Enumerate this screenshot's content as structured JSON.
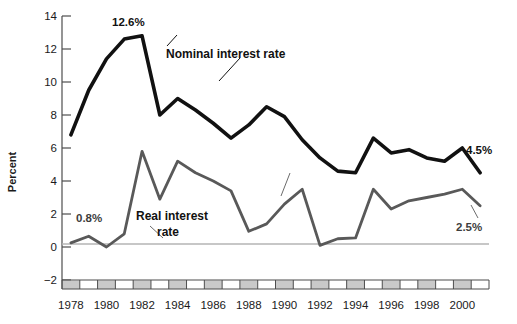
{
  "chart_data": {
    "type": "line",
    "title": "",
    "xlabel": "",
    "ylabel": "Percent",
    "ylim": [
      -2,
      14
    ],
    "xlim": [
      1977.5,
      2001.5
    ],
    "yticks": [
      -2,
      0,
      2,
      4,
      6,
      8,
      10,
      12,
      14
    ],
    "ytick_labels": [
      "−2",
      "0",
      "2",
      "4",
      "6",
      "8",
      "10",
      "12",
      "14"
    ],
    "xticks": [
      1978,
      1980,
      1982,
      1984,
      1986,
      1988,
      1990,
      1992,
      1994,
      1996,
      1998,
      2000
    ],
    "xtick_labels": [
      "1978",
      "1980",
      "1982",
      "1984",
      "1986",
      "1988",
      "1990",
      "1992",
      "1994",
      "1996",
      "1998",
      "2000"
    ],
    "grid": false,
    "legend_position": "inline-annotation",
    "zero_line": true,
    "x": [
      1978,
      1979,
      1980,
      1981,
      1982,
      1983,
      1984,
      1985,
      1986,
      1987,
      1988,
      1989,
      1990,
      1991,
      1992,
      1993,
      1994,
      1995,
      1996,
      1997,
      1998,
      1999,
      2000,
      2001
    ],
    "series": [
      {
        "name": "Nominal interest rate",
        "color": "#111111",
        "width": 3.6,
        "values": [
          6.8,
          9.5,
          11.4,
          12.6,
          12.8,
          8.0,
          9.0,
          8.3,
          7.5,
          6.6,
          7.4,
          8.5,
          7.9,
          6.5,
          5.4,
          4.6,
          4.5,
          6.6,
          5.7,
          5.9,
          5.4,
          5.2,
          6.0,
          4.5
        ]
      },
      {
        "name": "Real interest rate",
        "color": "#595959",
        "width": 2.8,
        "values": [
          0.25,
          0.65,
          0.0,
          0.8,
          5.8,
          2.9,
          5.2,
          4.5,
          4.0,
          3.4,
          0.95,
          1.4,
          2.6,
          3.5,
          0.1,
          0.5,
          0.55,
          3.5,
          2.3,
          2.8,
          3.0,
          3.2,
          3.5,
          2.5
        ]
      }
    ],
    "annotations": [
      {
        "label": "12.6%",
        "style": "bold-dark",
        "x": 1981,
        "y": 12.6
      },
      {
        "label": "4.5%",
        "style": "bold-dark",
        "x": 2001,
        "y": 4.5
      },
      {
        "label": "0.8%",
        "style": "bold-gray",
        "x": 1981,
        "y": 0.8
      },
      {
        "label": "2.5%",
        "style": "bold-gray",
        "x": 2001,
        "y": 2.5
      }
    ],
    "series_labels": [
      {
        "label": "Nominal interest rate",
        "points_to": "nominal-series"
      },
      {
        "label": "Real interest",
        "label2": "rate",
        "points_to": "real-series"
      }
    ]
  },
  "axis": {
    "y_title": "Percent",
    "x_band_style": "alternating-gray-year-blocks"
  },
  "colors": {
    "nominal": "#111111",
    "real": "#595959",
    "zero_line": "#b5b5b5",
    "axis": "#4d4d4d",
    "band_fill": "#c9c9c9",
    "background": "#ffffff"
  }
}
